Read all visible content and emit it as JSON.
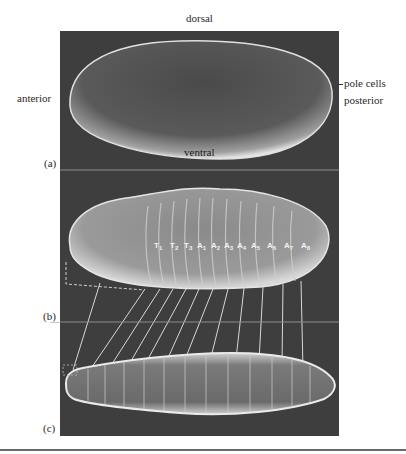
{
  "figure": {
    "labels": {
      "dorsal": "dorsal",
      "anterior": "anterior",
      "pole_cells": "pole cells",
      "posterior": "posterior",
      "ventral": "ventral"
    },
    "panels": [
      {
        "id": "a",
        "label": "(a)",
        "content": "early embryo (egg) scanning electron micrograph"
      },
      {
        "id": "b",
        "label": "(b)",
        "content": "segmented embryo scanning electron micrograph"
      },
      {
        "id": "c",
        "label": "(c)",
        "content": "larva scanning electron micrograph"
      }
    ],
    "segments": [
      {
        "letter": "T",
        "num": "1"
      },
      {
        "letter": "T",
        "num": "2"
      },
      {
        "letter": "T",
        "num": "3"
      },
      {
        "letter": "A",
        "num": "1"
      },
      {
        "letter": "A",
        "num": "2"
      },
      {
        "letter": "A",
        "num": "3"
      },
      {
        "letter": "A",
        "num": "4"
      },
      {
        "letter": "A",
        "num": "5"
      },
      {
        "letter": "A",
        "num": "6"
      },
      {
        "letter": "A",
        "num": "7"
      },
      {
        "letter": "A",
        "num": "8"
      }
    ],
    "colors": {
      "panel_bg": "#3e3e3e",
      "specimen_light": "#e8e8e8",
      "connector_lines": "#d8d8d8"
    }
  }
}
